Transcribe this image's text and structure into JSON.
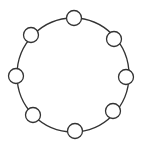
{
  "diagram": {
    "type": "ring-topology",
    "background": "#ffffff",
    "stroke_color": "#333333",
    "ring": {
      "cx": 73,
      "cy": 75,
      "rx": 56,
      "ry": 57,
      "stroke_width": 1.3
    },
    "node_radius": 7.5,
    "node_fill": "#ffffff",
    "node_stroke_width": 1.3,
    "nodes": [
      {
        "id": "top",
        "cx": 74,
        "cy": 18
      },
      {
        "id": "top-right",
        "cx": 114,
        "cy": 39
      },
      {
        "id": "right",
        "cx": 126,
        "cy": 77
      },
      {
        "id": "bottom-right",
        "cx": 113,
        "cy": 111
      },
      {
        "id": "bottom",
        "cx": 75,
        "cy": 131
      },
      {
        "id": "bottom-left",
        "cx": 33,
        "cy": 115
      },
      {
        "id": "left",
        "cx": 16,
        "cy": 76
      },
      {
        "id": "top-left",
        "cx": 31,
        "cy": 35
      }
    ]
  }
}
